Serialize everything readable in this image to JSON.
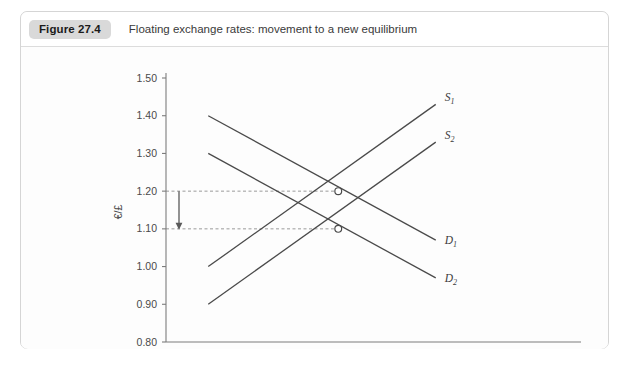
{
  "figure": {
    "badge": "Figure 27.4",
    "caption": "Floating exchange rates: movement to a new equilibrium"
  },
  "chart_data": {
    "type": "line",
    "title": "Floating exchange rates: movement to a new equilibrium",
    "xlabel": "Quantity of £s",
    "ylabel": "€/£",
    "origin_label": "0",
    "ylim": [
      0.8,
      1.5
    ],
    "yticks": [
      "1.50",
      "1.40",
      "1.30",
      "1.20",
      "1.10",
      "1.00",
      "0.90",
      "0.80"
    ],
    "ytick_values": [
      1.5,
      1.4,
      1.3,
      1.2,
      1.1,
      1.0,
      0.9,
      0.8
    ],
    "xlim": [
      0,
      100
    ],
    "xticks": [],
    "grid": false,
    "legend": "inline-curve-labels",
    "series": [
      {
        "name": "S1",
        "label": "S",
        "subscript": "1",
        "kind": "supply",
        "points": [
          [
            13,
            1.0
          ],
          [
            83,
            1.43
          ]
        ]
      },
      {
        "name": "S2",
        "label": "S",
        "subscript": "2",
        "kind": "supply",
        "points": [
          [
            13,
            0.9
          ],
          [
            83,
            1.33
          ]
        ]
      },
      {
        "name": "D1",
        "label": "D",
        "subscript": "1",
        "kind": "demand",
        "points": [
          [
            13,
            1.4
          ],
          [
            83,
            1.07
          ]
        ]
      },
      {
        "name": "D2",
        "label": "D",
        "subscript": "2",
        "kind": "demand",
        "points": [
          [
            13,
            1.3
          ],
          [
            83,
            0.97
          ]
        ]
      }
    ],
    "equilibria": [
      {
        "name": "initial-equilibrium",
        "x": 53,
        "y": 1.2
      },
      {
        "name": "new-equilibrium",
        "x": 53,
        "y": 1.1
      }
    ],
    "guide_lines": [
      {
        "name": "guide-120",
        "y": 1.2,
        "from_x": 0,
        "to_x": 53
      },
      {
        "name": "guide-110",
        "y": 1.1,
        "from_x": 0,
        "to_x": 53
      }
    ],
    "annotations": [
      {
        "name": "depreciation-arrow",
        "type": "arrow",
        "direction": "down",
        "from": 1.2,
        "to": 1.1,
        "x": 4
      }
    ]
  }
}
